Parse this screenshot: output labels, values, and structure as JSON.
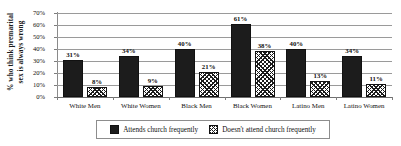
{
  "chart_data": {
    "type": "bar",
    "title": "",
    "xlabel": "",
    "ylabel_lines": [
      "% who think premarital",
      "sex is always wrong"
    ],
    "ylabel": "% who think premarital sex is always wrong",
    "categories": [
      "White Men",
      "White Women",
      "Black Men",
      "Black Women",
      "Latino Men",
      "Latino Women"
    ],
    "series": [
      {
        "name": "Attends church frequently",
        "values": [
          31,
          34,
          40,
          61,
          40,
          34
        ],
        "labels": [
          "31%",
          "34%",
          "40%",
          "61%",
          "40%",
          "34%"
        ],
        "fill": "solid-black",
        "color": "#1c1c1c"
      },
      {
        "name": "Doesn't attend church frequently",
        "values": [
          8,
          9,
          21,
          38,
          13,
          11
        ],
        "labels": [
          "8%",
          "9%",
          "21%",
          "38%",
          "13%",
          "11%"
        ],
        "fill": "diagonal-hatch",
        "color": "#ffffff"
      }
    ],
    "ylim": [
      0,
      70
    ],
    "ytick_values": [
      0,
      10,
      20,
      30,
      40,
      50,
      60,
      70
    ],
    "ytick_labels": [
      "0%",
      "10%",
      "20%",
      "30%",
      "40%",
      "50%",
      "60%",
      "70%"
    ],
    "grid": true,
    "grid_axis": "y",
    "legend_position": "bottom",
    "legend_entries": [
      "Attends church frequently",
      "Doesn't attend church frequently"
    ]
  }
}
